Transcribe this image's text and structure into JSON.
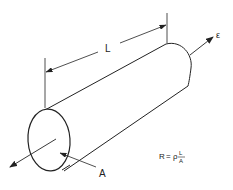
{
  "diagram": {
    "labels": {
      "length": "L",
      "area": "A",
      "field": "ε"
    },
    "formula": {
      "lhs": "R",
      "equals": "=",
      "rho": "ρ",
      "numerator": "L",
      "denominator": "A"
    },
    "colors": {
      "stroke": "#222222",
      "background": "#ffffff"
    }
  }
}
